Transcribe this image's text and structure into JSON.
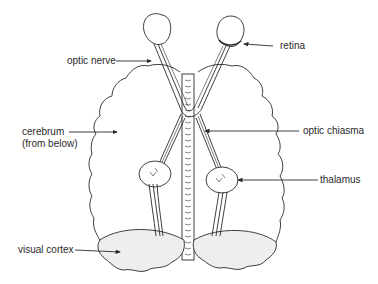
{
  "diagram": {
    "colors": {
      "line": "#2a2a2a",
      "cortex_fill": "#eeeeee",
      "background": "#ffffff"
    },
    "labels": {
      "optic_nerve": "optic nerve",
      "retina": "retina",
      "cerebrum_line1": "cerebrum",
      "cerebrum_line2": "(from below)",
      "optic_chiasma": "optic chiasma",
      "thalamus": "thalamus",
      "visual_cortex": "visual cortex"
    }
  }
}
